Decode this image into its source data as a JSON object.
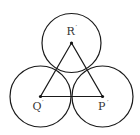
{
  "diagram": {
    "stroke_color": "#1a1a1a",
    "circles": [
      {
        "name": "R",
        "cx": 71.5,
        "cy": 43,
        "r": 29.5
      },
      {
        "name": "Q",
        "cx": 40.5,
        "cy": 96.5,
        "r": 30.5
      },
      {
        "name": "P",
        "cx": 102.5,
        "cy": 96.5,
        "r": 30.5
      }
    ],
    "points": [
      {
        "label": "R",
        "prime": "′",
        "x": 71.5,
        "y": 43
      },
      {
        "label": "Q",
        "prime": "′",
        "x": 40.5,
        "y": 96.5
      },
      {
        "label": "P",
        "prime": "′",
        "x": 102.5,
        "y": 96.5
      }
    ],
    "labels": {
      "R": "R",
      "Q": "Q",
      "P": "P",
      "prime": "′"
    }
  }
}
